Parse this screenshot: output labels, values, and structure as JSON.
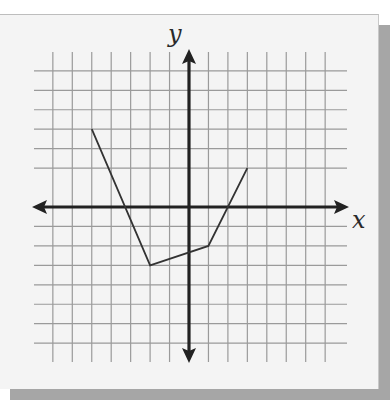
{
  "chart_data": {
    "type": "line",
    "title": "",
    "xlabel": "x",
    "ylabel": "y",
    "xlim": [
      -8,
      8
    ],
    "ylim": [
      -7,
      7
    ],
    "grid": true,
    "grid_x_lines": [
      -7,
      -6,
      -5,
      -4,
      -3,
      -2,
      -1,
      1,
      2,
      3,
      4,
      5,
      6,
      7
    ],
    "grid_y_lines": [
      7,
      6,
      5,
      4,
      3,
      2,
      -1,
      -2,
      -3,
      -4,
      -5,
      -6,
      -7
    ],
    "tick_labels": "none",
    "series": [
      {
        "name": "piecewise linear function",
        "points": [
          [
            -5,
            4
          ],
          [
            -2,
            -3
          ],
          [
            1,
            -2
          ],
          [
            3,
            2
          ]
        ],
        "color": "#333333"
      }
    ],
    "axes_arrows": true
  },
  "labels": {
    "x_axis": "x",
    "y_axis": "y"
  },
  "colors": {
    "card_background": "#f4f4f4",
    "shadow": "#a6a6a6",
    "grid": "#9a9a9a",
    "axes": "#222222",
    "curve": "#333333"
  }
}
